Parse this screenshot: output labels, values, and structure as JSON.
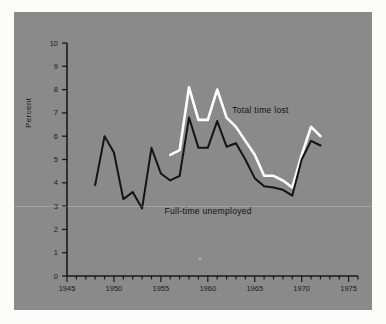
{
  "figure": {
    "background_color": "#fcfcfa",
    "panel_color": "#8a8a8a"
  },
  "chart_data": {
    "type": "line",
    "title": "",
    "xlabel": "",
    "ylabel": "Percent",
    "xlim": [
      1945,
      1976
    ],
    "ylim": [
      0,
      10
    ],
    "xticks": [
      1945,
      1950,
      1955,
      1960,
      1965,
      1970,
      1975
    ],
    "xtick_labels": [
      "1945",
      "1950",
      "1955",
      "1960",
      "1965",
      "1970",
      "1975"
    ],
    "xminor_step": 1,
    "yticks": [
      0,
      1,
      2,
      3,
      4,
      5,
      6,
      7,
      8,
      9,
      10
    ],
    "ytick_labels": [
      "0",
      "1",
      "2",
      "3",
      "4",
      "5",
      "6",
      "7",
      "8",
      "9",
      "10"
    ],
    "grid": false,
    "legend_position": "inline-annotation",
    "series": [
      {
        "name": "Total time lost",
        "color": "#ffffff",
        "label_color": "#111111",
        "x": [
          1956,
          1957,
          1958,
          1959,
          1960,
          1961,
          1962,
          1963,
          1964,
          1965,
          1966,
          1967,
          1968,
          1969,
          1970,
          1971,
          1972
        ],
        "values": [
          5.2,
          5.4,
          8.1,
          6.7,
          6.7,
          8.0,
          6.8,
          6.4,
          5.8,
          5.2,
          4.3,
          4.3,
          4.1,
          3.8,
          5.2,
          6.4,
          6.0
        ]
      },
      {
        "name": "Full-time unemployed",
        "color": "#141414",
        "label_color": "#111111",
        "x": [
          1948,
          1949,
          1950,
          1951,
          1952,
          1953,
          1954,
          1955,
          1956,
          1957,
          1958,
          1959,
          1960,
          1961,
          1962,
          1963,
          1964,
          1965,
          1966,
          1967,
          1968,
          1969,
          1970,
          1971,
          1972
        ],
        "values": [
          3.9,
          6.0,
          5.3,
          3.3,
          3.6,
          2.9,
          5.5,
          4.4,
          4.1,
          4.3,
          6.8,
          5.5,
          5.5,
          6.65,
          5.55,
          5.7,
          5.0,
          4.2,
          3.85,
          3.8,
          3.7,
          3.45,
          5.0,
          5.8,
          5.6
        ]
      }
    ],
    "annotations": [
      {
        "text": "Total time lost",
        "x": 1962.6,
        "y": 7.1
      },
      {
        "text": "Full-time unemployed",
        "x": 1955.4,
        "y": 2.75
      }
    ]
  }
}
